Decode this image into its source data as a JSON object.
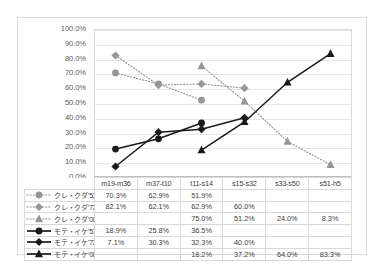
{
  "chart_data": {
    "type": "line",
    "title": "",
    "xlabel": "",
    "ylabel": "",
    "ylim": [
      0,
      100
    ],
    "ytick_labels": [
      "100.0%",
      "90.0%",
      "80.0%",
      "70.0%",
      "60.0%",
      "50.0%",
      "40.0%",
      "30.0%",
      "20.0%",
      "10.0%",
      "0.0%"
    ],
    "ytick_values": [
      100,
      90,
      80,
      70,
      60,
      50,
      40,
      30,
      20,
      10,
      0
    ],
    "grid": true,
    "legend_position": "data-table-left",
    "categories": [
      "m19-m36",
      "m37-t10",
      "t11-s14",
      "s15-s32",
      "s33-s50",
      "s51-h5"
    ],
    "series": [
      {
        "name": "クレ・クダ'53",
        "marker": "circle",
        "line_style": "dotted",
        "color": "#969696",
        "values": [
          70.3,
          62.9,
          51.9,
          null,
          null,
          null
        ],
        "labels": [
          "70.3%",
          "62.9%",
          "51.9%",
          "",
          "",
          ""
        ]
      },
      {
        "name": "クレ・クダ'72",
        "marker": "diamond",
        "line_style": "dotted",
        "color": "#969696",
        "values": [
          82.1,
          62.1,
          62.9,
          60.0,
          null,
          null
        ],
        "labels": [
          "82.1%",
          "62.1%",
          "62.9%",
          "60.0%",
          "",
          ""
        ]
      },
      {
        "name": "クレ・クダ'08",
        "marker": "triangle",
        "line_style": "dotted",
        "color": "#969696",
        "values": [
          null,
          null,
          75.0,
          51.2,
          24.0,
          8.3
        ],
        "labels": [
          "",
          "",
          "75.0%",
          "51.2%",
          "24.0%",
          "8.3%"
        ]
      },
      {
        "name": "モテ・イケ'53",
        "marker": "circle",
        "line_style": "solid",
        "color": "#1a1a1a",
        "values": [
          18.9,
          25.8,
          36.5,
          null,
          null,
          null
        ],
        "labels": [
          "18.9%",
          "25.8%",
          "36.5%",
          "",
          "",
          ""
        ]
      },
      {
        "name": "モテ・イケ'72",
        "marker": "diamond",
        "line_style": "solid",
        "color": "#1a1a1a",
        "values": [
          7.1,
          30.3,
          32.3,
          40.0,
          null,
          null
        ],
        "labels": [
          "7.1%",
          "30.3%",
          "32.3%",
          "40.0%",
          "",
          ""
        ]
      },
      {
        "name": "モテ・イケ'08",
        "marker": "triangle",
        "line_style": "solid",
        "color": "#1a1a1a",
        "values": [
          null,
          null,
          18.2,
          37.2,
          64.0,
          83.3
        ],
        "labels": [
          "",
          "",
          "18.2%",
          "37.2%",
          "64.0%",
          "83.3%"
        ]
      }
    ]
  },
  "colors": {
    "gray_series": "#969696",
    "black_series": "#1a1a1a",
    "gridline": "#e6e6e6",
    "border": "#d9d9d9",
    "text": "#404040"
  }
}
